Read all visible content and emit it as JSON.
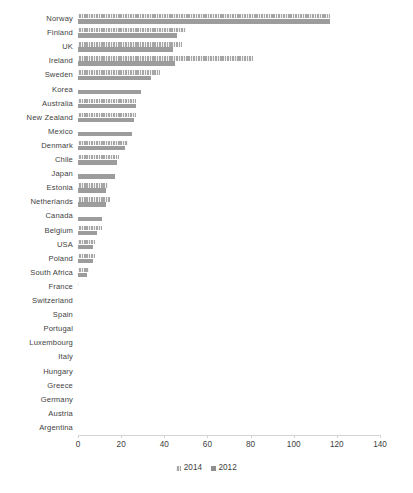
{
  "chart_data": {
    "type": "bar",
    "orientation": "horizontal",
    "title": "",
    "subtitle": "",
    "xlabel": "",
    "ylabel": "",
    "xlim": [
      0,
      140
    ],
    "xticks": [
      0,
      20,
      40,
      60,
      80,
      100,
      120,
      140
    ],
    "xtick_labels": [
      "0",
      "20",
      "40",
      "60",
      "80",
      "100",
      "120",
      "140"
    ],
    "grid": false,
    "legend_position": "bottom",
    "categories": [
      "Norway",
      "Finland",
      "UK",
      "Ireland",
      "Sweden",
      "Korea",
      "Australia",
      "New Zealand",
      "Mexico",
      "Denmark",
      "Chile",
      "Japan",
      "Estonia",
      "Netherlands",
      "Canada",
      "Belgium",
      "USA",
      "Poland",
      "South Africa",
      "France",
      "Switzerland",
      "Spain",
      "Portugal",
      "Luxembourg",
      "Italy",
      "Hungary",
      "Greece",
      "Germany",
      "Austria",
      "Argentina"
    ],
    "series": [
      {
        "name": "2014",
        "color": "#a6a6a6",
        "pattern": "hatched",
        "values": [
          117,
          50,
          48,
          81,
          38,
          0,
          27,
          27,
          0,
          23,
          19,
          0,
          14,
          15,
          0,
          11,
          8,
          8,
          5,
          0.4,
          0,
          0,
          0,
          0,
          0,
          0,
          0,
          0,
          0,
          0
        ]
      },
      {
        "name": "2012",
        "color": "#9c9c9c",
        "pattern": "solid",
        "values": [
          117,
          46,
          44,
          45,
          34,
          29,
          27,
          26,
          25,
          22,
          18,
          17,
          13,
          13,
          11,
          9,
          7,
          7,
          4,
          0,
          0,
          0,
          0,
          0,
          0,
          0,
          0,
          0,
          0,
          0
        ]
      }
    ],
    "legend": [
      {
        "label": "2014",
        "swatch_class": "s2014"
      },
      {
        "label": "2012",
        "swatch_class": "s2012"
      }
    ]
  }
}
